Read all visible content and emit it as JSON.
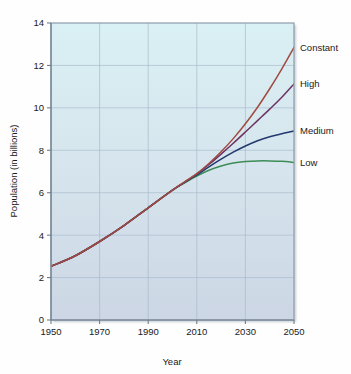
{
  "chart_data": {
    "type": "line",
    "title": "",
    "xlabel": "Year",
    "ylabel": "Population (in billions)",
    "xlim": [
      1950,
      2050
    ],
    "ylim": [
      0,
      14
    ],
    "xticks": [
      1950,
      1970,
      1990,
      2010,
      2030,
      2050
    ],
    "xtick_labels": [
      "1950",
      "1970",
      "1990",
      "2010",
      "2030",
      "2050"
    ],
    "yticks": [
      0,
      2,
      4,
      6,
      8,
      10,
      12,
      14
    ],
    "ytick_labels": [
      "0",
      "2",
      "4",
      "6",
      "8",
      "10",
      "12",
      "14"
    ],
    "grid": true,
    "legend_position": "right-inline-labels",
    "series": [
      {
        "name": "Constant",
        "color": "#a04a40",
        "label": "Constant",
        "x": [
          1950,
          1960,
          1970,
          1980,
          1990,
          2000,
          2005,
          2010,
          2015,
          2020,
          2025,
          2030,
          2035,
          2040,
          2045,
          2050
        ],
        "values": [
          2.53,
          3.03,
          3.7,
          4.45,
          5.29,
          6.12,
          6.51,
          6.9,
          7.38,
          7.93,
          8.55,
          9.25,
          10.03,
          10.9,
          11.84,
          12.85
        ]
      },
      {
        "name": "High",
        "color": "#6d3261",
        "label": "High",
        "x": [
          1950,
          1960,
          1970,
          1980,
          1990,
          2000,
          2005,
          2010,
          2015,
          2020,
          2025,
          2030,
          2035,
          2040,
          2045,
          2050
        ],
        "values": [
          2.53,
          3.03,
          3.7,
          4.45,
          5.29,
          6.12,
          6.5,
          6.89,
          7.33,
          7.82,
          8.33,
          8.86,
          9.4,
          9.94,
          10.5,
          11.13
        ]
      },
      {
        "name": "Medium",
        "color": "#22386e",
        "label": "Medium",
        "x": [
          1950,
          1960,
          1970,
          1980,
          1990,
          2000,
          2005,
          2010,
          2015,
          2020,
          2025,
          2030,
          2035,
          2040,
          2045,
          2050
        ],
        "values": [
          2.53,
          3.03,
          3.7,
          4.45,
          5.29,
          6.12,
          6.49,
          6.84,
          7.22,
          7.58,
          7.91,
          8.2,
          8.45,
          8.64,
          8.78,
          8.91
        ]
      },
      {
        "name": "Low",
        "color": "#3d8c55",
        "label": "Low",
        "x": [
          1950,
          1960,
          1970,
          1980,
          1990,
          2000,
          2005,
          2010,
          2015,
          2020,
          2025,
          2030,
          2035,
          2040,
          2045,
          2050
        ],
        "values": [
          2.53,
          3.03,
          3.7,
          4.45,
          5.29,
          6.12,
          6.47,
          6.79,
          7.06,
          7.26,
          7.4,
          7.47,
          7.5,
          7.5,
          7.48,
          7.43
        ]
      }
    ],
    "colors": {
      "plot_bg_top": "#d9f0f4",
      "plot_bg_bottom": "#ccd6e4",
      "grid": "#a9bccd",
      "axis": "#7a8a99",
      "text": "#1a1a1a"
    }
  }
}
